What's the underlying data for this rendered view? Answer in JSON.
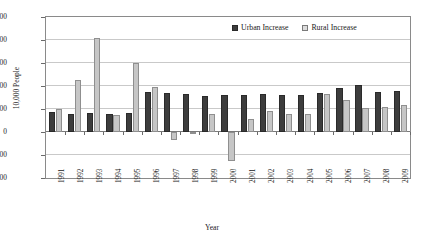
{
  "chart_data": {
    "type": "bar",
    "title": "",
    "xlabel": "Year",
    "ylabel": "10,000 People",
    "ylim": [
      -1000,
      2500
    ],
    "ystep": 500,
    "yticks": [
      "2500",
      "2000",
      "1500",
      "1000",
      "500",
      "0",
      "-500",
      "-1000"
    ],
    "grid": true,
    "legend_position": "top-right",
    "categories": [
      "1991",
      "1992",
      "1993",
      "1994",
      "1995",
      "1996",
      "1997",
      "1998",
      "1999",
      "2000",
      "2001",
      "2002",
      "2003",
      "2004",
      "2005",
      "2006",
      "2007",
      "2008",
      "2009"
    ],
    "series": [
      {
        "name": "Urban Increase",
        "color": "#3d3d3d",
        "values": [
          440,
          400,
          410,
          400,
          410,
          870,
          850,
          830,
          790,
          810,
          800,
          820,
          810,
          800,
          840,
          960,
          1020,
          870,
          890
        ]
      },
      {
        "name": "Rural Increase",
        "color": "#c6c6c6",
        "values": [
          500,
          1140,
          2050,
          380,
          1500,
          970,
          -180,
          -40,
          390,
          -620,
          290,
          450,
          390,
          400,
          820,
          700,
          530,
          550,
          590
        ]
      }
    ]
  },
  "legend": {
    "items": [
      {
        "label": "Urban Increase"
      },
      {
        "label": "Rural Increase"
      }
    ]
  }
}
